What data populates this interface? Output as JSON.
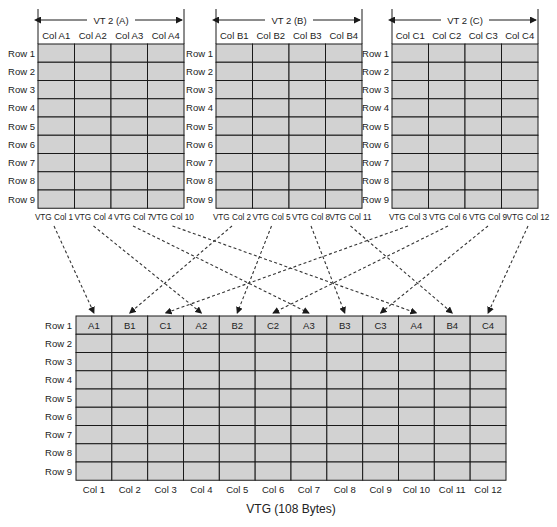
{
  "source_groups": [
    {
      "id": "A",
      "title": "VT 2 (A)",
      "columns": [
        "Col A1",
        "Col A2",
        "Col A3",
        "Col A4"
      ],
      "rows": [
        "Row 1",
        "Row 2",
        "Row 3",
        "Row 4",
        "Row 5",
        "Row 6",
        "Row 7",
        "Row 8",
        "Row 9"
      ],
      "vtg_columns": [
        "VTG Col 1",
        "VTG Col 4",
        "VTG Col 7",
        "VTG Col 10"
      ],
      "targets": [
        1,
        4,
        7,
        10
      ]
    },
    {
      "id": "B",
      "title": "VT 2 (B)",
      "columns": [
        "Col B1",
        "Col B2",
        "Col B3",
        "Col B4"
      ],
      "rows": [
        "Row 1",
        "Row 2",
        "Row 3",
        "Row 4",
        "Row 5",
        "Row 6",
        "Row 7",
        "Row 8",
        "Row 9"
      ],
      "vtg_columns": [
        "VTG Col 2",
        "VTG Col 5",
        "VTG Col 8",
        "VTG Col 11"
      ],
      "targets": [
        2,
        5,
        8,
        11
      ]
    },
    {
      "id": "C",
      "title": "VT 2 (C)",
      "columns": [
        "Col C1",
        "Col C2",
        "Col C3",
        "Col C4"
      ],
      "rows": [
        "Row 1",
        "Row 2",
        "Row 3",
        "Row 4",
        "Row 5",
        "Row 6",
        "Row 7",
        "Row 8",
        "Row 9"
      ],
      "vtg_columns": [
        "VTG Col 3",
        "VTG Col 6",
        "VTG Col 9",
        "VTG Col 12"
      ],
      "targets": [
        3,
        6,
        9,
        12
      ]
    }
  ],
  "vtg": {
    "title": "VTG (108 Bytes)",
    "rows": [
      "Row 1",
      "Row 2",
      "Row 3",
      "Row 4",
      "Row 5",
      "Row 6",
      "Row 7",
      "Row 8",
      "Row 9"
    ],
    "columns": [
      "Col 1",
      "Col 2",
      "Col 3",
      "Col 4",
      "Col 5",
      "Col 6",
      "Col 7",
      "Col 8",
      "Col 9",
      "Col 10",
      "Col 11",
      "Col 12"
    ],
    "row1_cells": [
      "A1",
      "B1",
      "C1",
      "A2",
      "B2",
      "C2",
      "A3",
      "B3",
      "C3",
      "A4",
      "B4",
      "C4"
    ]
  },
  "colors": {
    "cell_fill": "#d2d2d2",
    "line": "#1a1a1a"
  }
}
